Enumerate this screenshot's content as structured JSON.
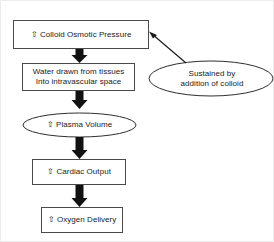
{
  "diagram": {
    "stroke_color": "#3b3b3b",
    "arrow_color": "#111111",
    "background": "#ffffff",
    "nodes": {
      "colloid_osmotic_pressure": {
        "shape": "rectangle",
        "text": "⇧ Colloid Osmotic Pressure"
      },
      "water_drawn": {
        "shape": "rectangle",
        "text": "Water drawn from tissues\nInto intravascular space"
      },
      "plasma_volume": {
        "shape": "ellipse",
        "text": "⇧ Plasma Volume"
      },
      "cardiac_output": {
        "shape": "rectangle",
        "text": "⇧ Cardiac Output"
      },
      "oxygen_delivery": {
        "shape": "rectangle",
        "text": "⇧ Oxygen Delivery"
      },
      "sustained_by": {
        "shape": "ellipse",
        "text": "Sustained by\naddition of colloid"
      }
    },
    "connectors": {
      "cop_to_water": "down-block-arrow",
      "water_to_plasma": "down-block-arrow",
      "plasma_to_cardiac": "down-block-arrow",
      "cardiac_to_oxygen": "down-block-arrow",
      "sustained_to_cop": "line-arrow"
    }
  }
}
